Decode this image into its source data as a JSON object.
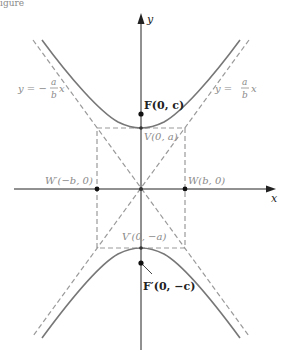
{
  "figure": {
    "caption_fragment": "igure",
    "axes": {
      "x_label": "x",
      "y_label": "y"
    },
    "asymptotes": {
      "left_label": {
        "lhs": "y = −",
        "num": "a",
        "den": "b",
        "rhs": "x"
      },
      "right_label": {
        "lhs": "y = ",
        "num": "a",
        "den": "b",
        "rhs": "x"
      }
    },
    "points": {
      "focus_top": "F(0, c)",
      "vertex_top": "V(0, a)",
      "w_left": "W′(−b, 0)",
      "w_right": "W(b, 0)",
      "vertex_bottom": "V′(0, −a)",
      "focus_bottom": "F′(0, −c)"
    },
    "colors": {
      "curve": "#777777",
      "dashed": "#9a9a9a",
      "axis": "#222222",
      "text_dark": "#222222",
      "text_gray": "#8a8a8a"
    }
  }
}
